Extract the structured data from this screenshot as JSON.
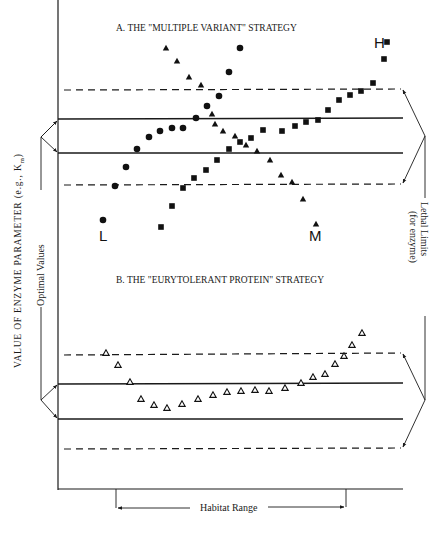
{
  "figure": {
    "y_axis_label": "VALUE OF ENZYME PARAMETER (e.g., K",
    "y_axis_label_sub": "m",
    "y_axis_label_end": ")",
    "left_bracket_label": "Optimal Values",
    "right_bracket_label_line1": "Lethal Limits",
    "right_bracket_label_line2": "(for enzyme)",
    "x_bracket_label": "Habitat Range"
  },
  "panel_a": {
    "title": "A. THE \"MULTIPLE VARIANT\" STRATEGY",
    "label_L": "L",
    "label_M": "M",
    "label_H": "H"
  },
  "panel_b": {
    "title": "B. THE \"EURYTOLERANT PROTEIN\" STRATEGY"
  },
  "chart_data": {
    "type": "scatter",
    "xlabel": "Habitat Range",
    "ylabel": "VALUE OF ENZYME PARAMETER (e.g., Km)",
    "panels": [
      {
        "name": "A. THE \"MULTIPLE VARIANT\" STRATEGY",
        "bands": {
          "lethal_upper": 90,
          "optimal_upper": 118,
          "optimal_lower": 153,
          "lethal_lower": 184
        },
        "series": [
          {
            "name": "L (circles)",
            "marker": "filled-circle",
            "points": [
              [
                103,
                220
              ],
              [
                115,
                186
              ],
              [
                126,
                167
              ],
              [
                137,
                149
              ],
              [
                149,
                137
              ],
              [
                160,
                131
              ],
              [
                172,
                128
              ],
              [
                183,
                128
              ],
              [
                196,
                118
              ],
              [
                207,
                106
              ],
              [
                219,
                96
              ],
              [
                229,
                72
              ],
              [
                240,
                48
              ]
            ]
          },
          {
            "name": "M (triangles)",
            "marker": "filled-triangle",
            "points": [
              [
                166,
                48
              ],
              [
                177,
                61
              ],
              [
                189,
                77
              ],
              [
                201,
                85
              ],
              [
                212,
                114
              ],
              [
                215,
                124
              ],
              [
                223,
                131
              ],
              [
                235,
                136
              ],
              [
                246,
                145
              ],
              [
                257,
                151
              ],
              [
                270,
                160
              ],
              [
                281,
                175
              ],
              [
                292,
                182
              ],
              [
                303,
                199
              ],
              [
                316,
                224
              ]
            ]
          },
          {
            "name": "H (squares)",
            "marker": "filled-square",
            "points": [
              [
                161,
                227
              ],
              [
                172,
                206
              ],
              [
                183,
                188
              ],
              [
                194,
                178
              ],
              [
                206,
                170
              ],
              [
                217,
                160
              ],
              [
                229,
                149
              ],
              [
                240,
                142
              ],
              [
                251,
                138
              ],
              [
                263,
                130
              ],
              [
                282,
                131
              ],
              [
                295,
                126
              ],
              [
                306,
                122
              ],
              [
                318,
                120
              ],
              [
                328,
                110
              ],
              [
                339,
                100
              ],
              [
                350,
                95
              ],
              [
                361,
                91
              ],
              [
                373,
                83
              ],
              [
                384,
                59
              ],
              [
                387,
                42
              ]
            ]
          }
        ]
      },
      {
        "name": "B. THE \"EURYTOLERANT PROTEIN\" STRATEGY",
        "bands": {
          "lethal_upper": 355,
          "optimal_upper": 383,
          "optimal_lower": 419,
          "lethal_lower": 449
        },
        "series": [
          {
            "name": "eurytolerant (open triangles)",
            "marker": "open-triangle",
            "points": [
              [
                106,
                353
              ],
              [
                118,
                365
              ],
              [
                130,
                382
              ],
              [
                141,
                399
              ],
              [
                154,
                405
              ],
              [
                167,
                408
              ],
              [
                182,
                404
              ],
              [
                198,
                399
              ],
              [
                213,
                395
              ],
              [
                227,
                392
              ],
              [
                241,
                391
              ],
              [
                255,
                390
              ],
              [
                269,
                391
              ],
              [
                285,
                388
              ],
              [
                301,
                383
              ],
              [
                313,
                377
              ],
              [
                325,
                374
              ],
              [
                335,
                364
              ],
              [
                344,
                356
              ],
              [
                352,
                345
              ],
              [
                362,
                333
              ]
            ]
          }
        ]
      }
    ],
    "habitat_range": [
      116,
      346
    ],
    "grid": false
  }
}
